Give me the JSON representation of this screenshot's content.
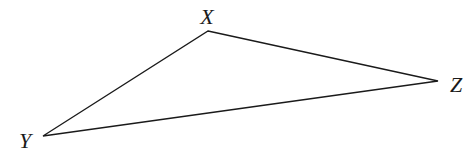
{
  "diagram": {
    "type": "triangle",
    "stroke_color": "#1a1a1a",
    "vertices": [
      {
        "name": "X",
        "x": 208,
        "y": 31,
        "label_x": 207,
        "label_y": 24
      },
      {
        "name": "Y",
        "x": 43,
        "y": 136,
        "label_x": 25,
        "label_y": 148
      },
      {
        "name": "Z",
        "x": 438,
        "y": 81,
        "label_x": 456,
        "label_y": 92
      }
    ],
    "edges": [
      {
        "from": "X",
        "to": "Z"
      },
      {
        "from": "Z",
        "to": "Y"
      },
      {
        "from": "Y",
        "to": "X"
      }
    ],
    "labels": {
      "X": "X",
      "Y": "Y",
      "Z": "Z"
    }
  }
}
